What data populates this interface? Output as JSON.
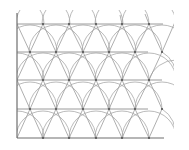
{
  "diagram": {
    "type": "triangular-lattice-with-arcs",
    "colors": {
      "background": "#ffffff",
      "axis": "#6e6e6e",
      "lattice_line": "#9a9a9a",
      "arc": "#a8a8a8",
      "vertex": "#555555"
    },
    "frame": {
      "left_axis": {
        "x": 17,
        "y1": 13,
        "y2": 138
      },
      "bottom_axis": {
        "y": 138,
        "x1": 17,
        "x2": 164
      }
    },
    "rows_y": [
      24,
      52,
      80,
      109,
      138
    ],
    "even_row_x": [
      17,
      43,
      69,
      96,
      122,
      149
    ],
    "odd_row_x": [
      30,
      56,
      83,
      109,
      135,
      162
    ],
    "horizontal_line_x_end": [
      163,
      148,
      162,
      148,
      164
    ],
    "arc_radius": 27
  }
}
